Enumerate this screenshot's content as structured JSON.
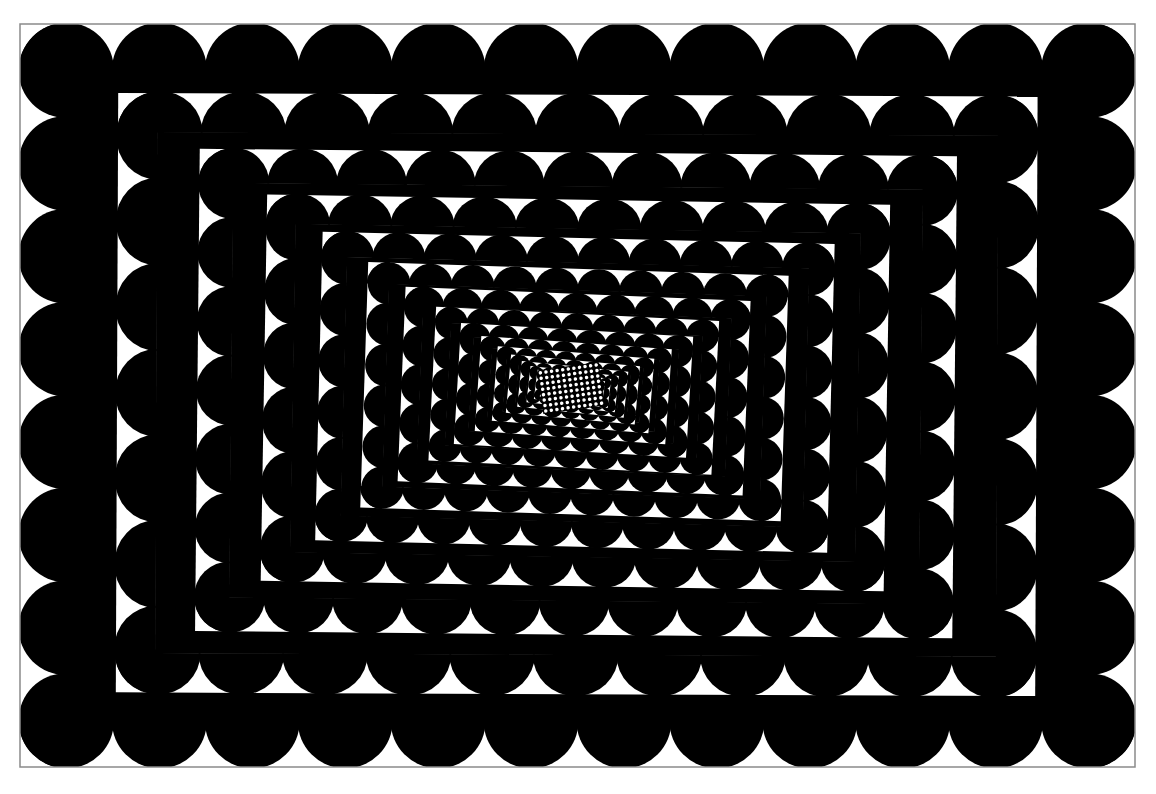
{
  "artwork": {
    "title": "Op-art tunnel of semicircles",
    "style": "black-and-white optical illusion",
    "colors": {
      "background": "#ffffff",
      "ink": "#000000",
      "frame": "#8a8a8a"
    },
    "frame": {
      "x": 20,
      "y": 24,
      "width": 1115,
      "height": 743
    },
    "center": {
      "x": 572,
      "y": 388
    },
    "rings": {
      "count": 22,
      "outer_band_depth": 46,
      "outer_dome_diameter": 94,
      "scale_per_ring": 0.86,
      "twist_total_deg": 12,
      "min_band_depth": 2.5
    },
    "core": {
      "x": 540,
      "y": 366,
      "width": 62,
      "height": 44,
      "rotation_deg": -8,
      "dot_cols": 11,
      "dot_rows": 8
    }
  }
}
